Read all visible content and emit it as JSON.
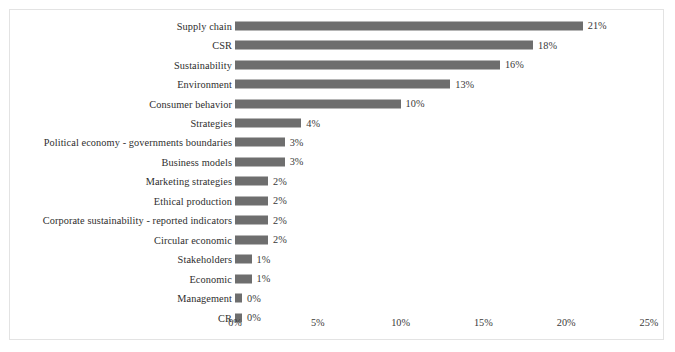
{
  "chart_data": {
    "type": "bar",
    "orientation": "horizontal",
    "title": "",
    "subtitle": "",
    "xlabel": "",
    "ylabel": "",
    "xlim": [
      0,
      25
    ],
    "grid": false,
    "legend": null,
    "bar_color": "#6e6e6e",
    "categories": [
      "Supply chain",
      "CSR",
      "Sustainability",
      "Environment",
      "Consumer behavior",
      "Strategies",
      "Political economy - governments  boundaries",
      "Business models",
      "Marketing strategies",
      "Ethical production",
      "Corporate sustainability - reported indicators",
      "Circular economic",
      "Stakeholders",
      "Economic",
      "Management",
      "CR"
    ],
    "values": [
      21,
      18,
      16,
      13,
      10,
      4,
      3,
      3,
      2,
      2,
      2,
      2,
      1,
      1,
      0,
      0
    ],
    "data_labels": [
      "21%",
      "18%",
      "16%",
      "13%",
      "10%",
      "4%",
      "3%",
      "3%",
      "2%",
      "2%",
      "2%",
      "2%",
      "1%",
      "1%",
      "0%",
      "0%"
    ],
    "xticks": [
      0,
      5,
      10,
      15,
      20,
      25
    ],
    "xticklabels": [
      "0%",
      "5%",
      "10%",
      "15%",
      "20%",
      "25%"
    ]
  }
}
